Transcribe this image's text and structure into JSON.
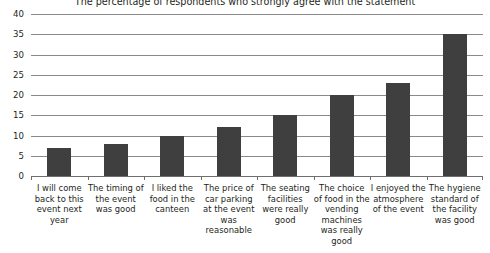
{
  "chart_data": {
    "type": "bar",
    "title": "The percentage of respondents who strongly agree with the statement",
    "xlabel": "",
    "ylabel": "",
    "ylim": [
      0,
      40
    ],
    "ytick_step": 5,
    "yticks": [
      "40",
      "35",
      "30",
      "25",
      "20",
      "15",
      "10",
      "5",
      "0"
    ],
    "grid": true,
    "legend": false,
    "bar_color": "#3f3f3f",
    "gridline_color": "#8a8a8a",
    "categories": [
      "I will come back to this event next year",
      "The timing of the event was good",
      "I liked the food in the canteen",
      "The price of car parking at the event was reasonable",
      "The seating facilities were really good",
      "The choice of food in the vending machines was really good",
      "I enjoyed the atmosphere of the event",
      "The hygiene standard of the facility was good"
    ],
    "values": [
      7,
      8,
      10,
      12,
      15,
      20,
      23,
      35
    ]
  }
}
